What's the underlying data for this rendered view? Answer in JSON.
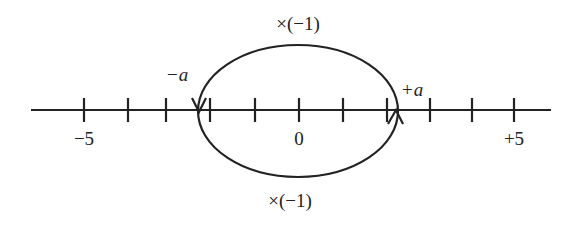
{
  "diagram": {
    "axis": {
      "x1": 31,
      "x2": 551,
      "y": 110,
      "color": "#222222"
    },
    "ticks": [
      {
        "x": 84,
        "label": "−5"
      },
      {
        "x": 128,
        "label": ""
      },
      {
        "x": 166,
        "label": ""
      },
      {
        "x": 210,
        "label": ""
      },
      {
        "x": 255,
        "label": ""
      },
      {
        "x": 299,
        "label": "0"
      },
      {
        "x": 343,
        "label": ""
      },
      {
        "x": 387,
        "label": ""
      },
      {
        "x": 430,
        "label": ""
      },
      {
        "x": 472,
        "label": ""
      },
      {
        "x": 514,
        "label": "+5"
      }
    ],
    "points": {
      "minus_a": {
        "label": "−a",
        "x": 185,
        "y": 81
      },
      "plus_a": {
        "label": "+a",
        "x": 400,
        "y": 96
      }
    },
    "loop": {
      "cx": 298,
      "cy": 111,
      "rx": 100,
      "ry": 66
    },
    "top_label": "×(−1)",
    "bottom_label": "×(−1)"
  }
}
